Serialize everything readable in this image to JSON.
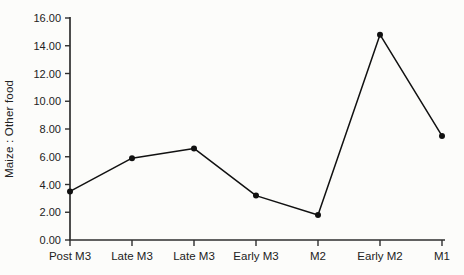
{
  "accent_colors": {
    "line": "#111111",
    "marker": "#111111",
    "axis": "#2e2e2e",
    "text": "#222222"
  },
  "chart_data": {
    "type": "line",
    "title": "",
    "xlabel": "",
    "ylabel": "Maize : Other food",
    "categories": [
      "Post M3",
      "Late M3",
      "Late M3",
      "Early M3",
      "M2",
      "Early M2",
      "M1"
    ],
    "series": [
      {
        "name": "Maize to other food ratio",
        "values": [
          3.5,
          5.9,
          6.6,
          3.2,
          1.8,
          14.8,
          7.5
        ]
      }
    ],
    "ylim": [
      0,
      16
    ],
    "ytick_step": 2,
    "ytick_labels": [
      "0.00",
      "2.00",
      "4.00",
      "6.00",
      "8.00",
      "10.00",
      "12.00",
      "14.00",
      "16.00"
    ],
    "grid": "off",
    "legend": "none",
    "marker": "filled-circle"
  }
}
